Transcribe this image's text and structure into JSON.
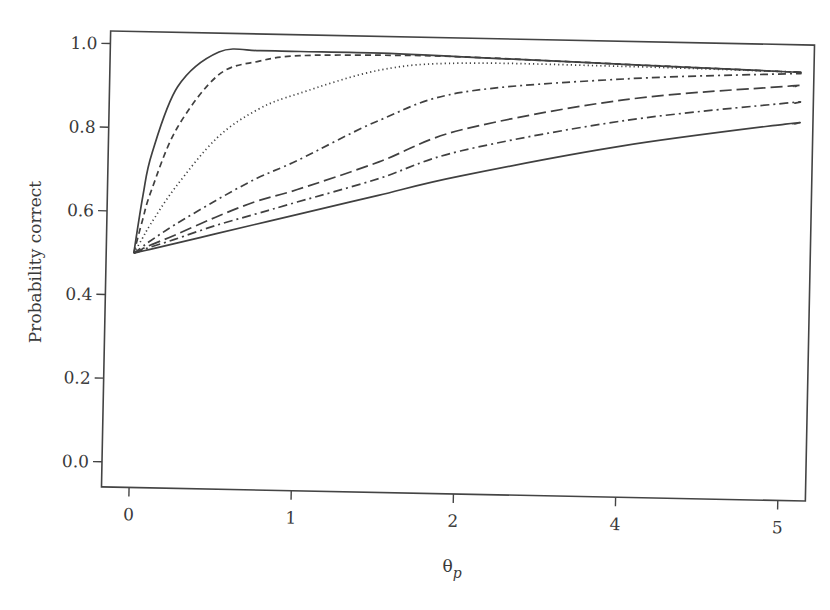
{
  "chart_data": {
    "type": "line",
    "title": "",
    "xlabel": "θp",
    "xlabel_main": "θ",
    "xlabel_sub": "p",
    "ylabel": "Probability correct",
    "x_tick_labels": [
      "0",
      "1",
      "2",
      "4",
      "5"
    ],
    "y_tick_labels": [
      "0.0",
      "0.2",
      "0.4",
      "0.6",
      "0.8",
      "1.0"
    ],
    "y_ticks": [
      0.0,
      0.2,
      0.4,
      0.6,
      0.8,
      1.0
    ],
    "ylim": [
      -0.06,
      1.03
    ],
    "xlim_slots": [
      -0.17,
      4.17
    ],
    "grid": false,
    "legend": "none",
    "x_note": "tick labels shown as 0,1,2,4,5 at equal spacing; x values below are in tick-slot units (0..4)",
    "x": [
      0,
      0.05,
      0.1,
      0.25,
      0.5,
      0.75,
      1,
      1.5,
      2,
      3,
      4,
      4.05
    ],
    "series": [
      {
        "name": "curve-1-solid",
        "style": "solid",
        "values": [
          0.5,
          0.64,
          0.74,
          0.9,
          0.985,
          0.99,
          0.99,
          0.99,
          0.985,
          0.975,
          0.965,
          0.965
        ]
      },
      {
        "name": "curve-2-dashed",
        "style": "dashed",
        "values": [
          0.5,
          0.58,
          0.65,
          0.8,
          0.93,
          0.965,
          0.98,
          0.985,
          0.985,
          0.975,
          0.965,
          0.965
        ]
      },
      {
        "name": "curve-3-dotted",
        "style": "dotted",
        "values": [
          0.5,
          0.535,
          0.57,
          0.66,
          0.78,
          0.85,
          0.89,
          0.95,
          0.97,
          0.97,
          0.965,
          0.965
        ]
      },
      {
        "name": "curve-4-dashdot",
        "style": "dashdot",
        "values": [
          0.5,
          0.515,
          0.53,
          0.57,
          0.63,
          0.685,
          0.73,
          0.83,
          0.9,
          0.94,
          0.96,
          0.96
        ]
      },
      {
        "name": "curve-5-longdash",
        "style": "longdash",
        "values": [
          0.5,
          0.51,
          0.52,
          0.545,
          0.59,
          0.63,
          0.66,
          0.73,
          0.81,
          0.89,
          0.93,
          0.93
        ]
      },
      {
        "name": "curve-6-dashdot2",
        "style": "dashdot2",
        "values": [
          0.5,
          0.507,
          0.515,
          0.535,
          0.57,
          0.6,
          0.63,
          0.69,
          0.76,
          0.84,
          0.89,
          0.89
        ]
      },
      {
        "name": "curve-7-solid",
        "style": "solid",
        "values": [
          0.5,
          0.505,
          0.51,
          0.525,
          0.55,
          0.575,
          0.6,
          0.65,
          0.7,
          0.78,
          0.84,
          0.84
        ]
      }
    ]
  },
  "colors": {
    "line": "#404040",
    "axis": "#444444",
    "text": "#3a3a3a",
    "background": "#ffffff"
  }
}
